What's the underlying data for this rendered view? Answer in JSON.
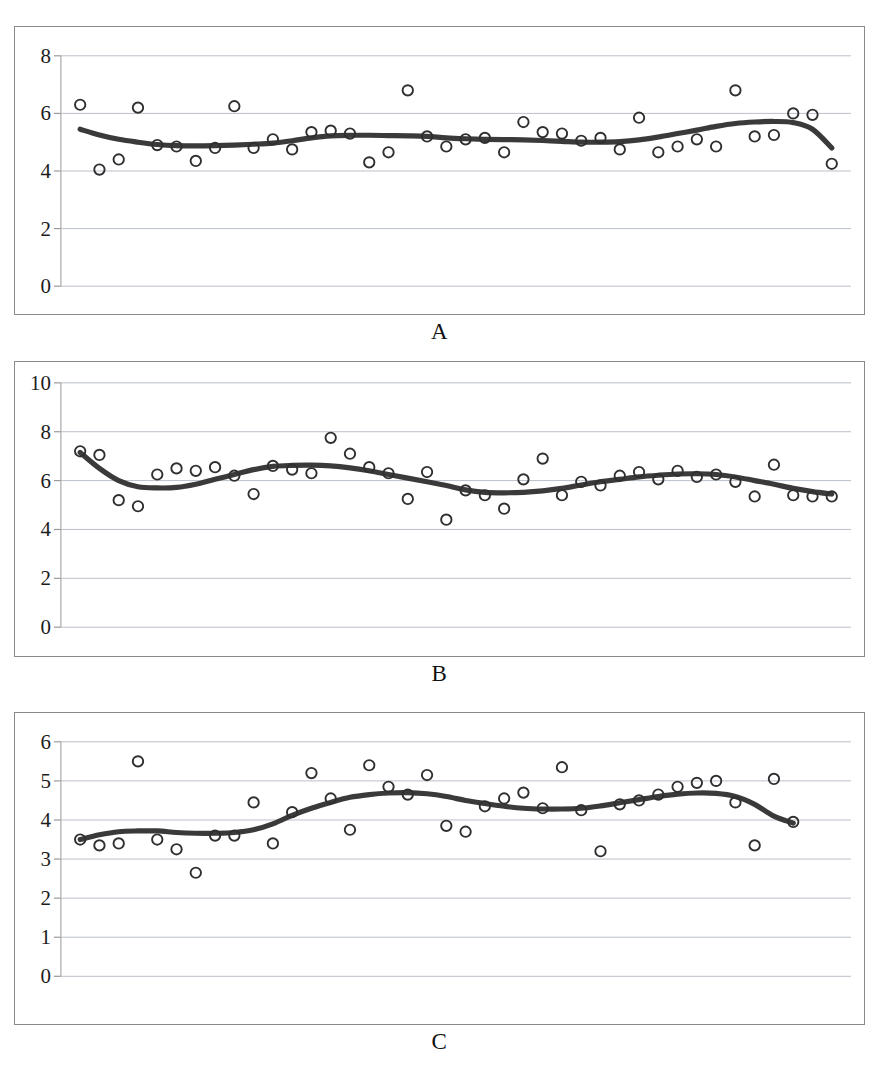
{
  "figure": {
    "background": "#ffffff",
    "marker_color": "#2f2f2f",
    "curve_color": "#3a3a3a",
    "grid_color": "#b9bfc9"
  },
  "panels": [
    {
      "id": "a",
      "caption": "A"
    },
    {
      "id": "b",
      "caption": "B"
    },
    {
      "id": "c",
      "caption": "C"
    }
  ],
  "chart_data": [
    {
      "type": "scatter",
      "title": "A",
      "xlabel": "",
      "ylabel": "",
      "grid": true,
      "legend": "none",
      "xlim": [
        0,
        41
      ],
      "ylim": [
        0,
        8
      ],
      "ytick_labels": [
        "0",
        "2",
        "4",
        "6",
        "8"
      ],
      "yticks": [
        0,
        2,
        4,
        6,
        8
      ],
      "xtick_labels": [],
      "x": [
        1,
        2,
        3,
        4,
        5,
        6,
        7,
        8,
        9,
        10,
        11,
        12,
        13,
        14,
        15,
        16,
        17,
        18,
        19,
        20,
        21,
        22,
        23,
        24,
        25,
        26,
        27,
        28,
        29,
        30,
        31,
        32,
        33,
        34,
        35,
        36,
        37,
        38,
        39,
        40
      ],
      "values": [
        6.3,
        4.05,
        4.4,
        6.2,
        4.9,
        4.85,
        4.35,
        4.8,
        6.25,
        4.8,
        5.1,
        4.75,
        5.35,
        5.4,
        5.3,
        4.3,
        4.65,
        6.8,
        5.2,
        4.85,
        5.1,
        5.15,
        4.65,
        5.7,
        5.35,
        5.3,
        5.05,
        5.15,
        4.75,
        5.85,
        4.65,
        4.85,
        5.1,
        4.85,
        6.8,
        5.2,
        5.25,
        6.0,
        5.95,
        4.25
      ],
      "series": [
        {
          "name": "observed",
          "marker": "open-circle",
          "values": [
            6.3,
            4.05,
            4.4,
            6.2,
            4.9,
            4.85,
            4.35,
            4.8,
            6.25,
            4.8,
            5.1,
            4.75,
            5.35,
            5.4,
            5.3,
            4.3,
            4.65,
            6.8,
            5.2,
            4.85,
            5.1,
            5.15,
            4.65,
            5.7,
            5.35,
            5.3,
            5.05,
            5.15,
            4.75,
            5.85,
            4.65,
            4.85,
            5.1,
            4.85,
            6.8,
            5.2,
            5.25,
            6.0,
            5.95,
            4.25
          ]
        },
        {
          "name": "smoothed-trend",
          "marker": "none",
          "values": [
            5.45,
            5.25,
            5.1,
            5.0,
            4.92,
            4.88,
            4.87,
            4.88,
            4.9,
            4.93,
            4.97,
            5.05,
            5.15,
            5.22,
            5.24,
            5.24,
            5.23,
            5.22,
            5.2,
            5.15,
            5.12,
            5.1,
            5.09,
            5.08,
            5.06,
            5.03,
            5.0,
            5.0,
            5.02,
            5.08,
            5.18,
            5.3,
            5.42,
            5.55,
            5.65,
            5.7,
            5.72,
            5.68,
            5.45,
            4.8
          ]
        }
      ]
    },
    {
      "type": "scatter",
      "title": "B",
      "xlabel": "",
      "ylabel": "",
      "grid": true,
      "legend": "none",
      "xlim": [
        0,
        41
      ],
      "ylim": [
        0,
        10
      ],
      "ytick_labels": [
        "0",
        "2",
        "4",
        "6",
        "8",
        "10"
      ],
      "yticks": [
        0,
        2,
        4,
        6,
        8,
        10
      ],
      "xtick_labels": [],
      "x": [
        1,
        2,
        3,
        4,
        5,
        6,
        7,
        8,
        9,
        10,
        11,
        12,
        13,
        14,
        15,
        16,
        17,
        18,
        19,
        20,
        21,
        22,
        23,
        24,
        25,
        26,
        27,
        28,
        29,
        30,
        31,
        32,
        33,
        34,
        35,
        36,
        37,
        38,
        39,
        40
      ],
      "values": [
        7.2,
        7.05,
        5.2,
        4.95,
        6.25,
        6.5,
        6.4,
        6.55,
        6.2,
        5.45,
        6.6,
        6.45,
        6.3,
        7.75,
        7.1,
        6.55,
        6.3,
        5.25,
        6.35,
        4.4,
        5.6,
        5.4,
        4.85,
        6.05,
        6.9,
        5.4,
        5.95,
        5.8,
        6.2,
        6.35,
        6.05,
        6.4,
        6.15,
        6.25,
        5.95,
        5.35,
        6.65,
        5.4,
        5.35,
        5.35
      ],
      "series": [
        {
          "name": "observed",
          "marker": "open-circle",
          "values": [
            7.2,
            7.05,
            5.2,
            4.95,
            6.25,
            6.5,
            6.4,
            6.55,
            6.2,
            5.45,
            6.6,
            6.45,
            6.3,
            7.75,
            7.1,
            6.55,
            6.3,
            5.25,
            6.35,
            4.4,
            5.6,
            5.4,
            4.85,
            6.05,
            6.9,
            5.4,
            5.95,
            5.8,
            6.2,
            6.35,
            6.05,
            6.4,
            6.15,
            6.25,
            5.95,
            5.35,
            6.65,
            5.4,
            5.35,
            5.35
          ]
        },
        {
          "name": "smoothed-trend",
          "marker": "none",
          "values": [
            7.15,
            6.5,
            6.0,
            5.75,
            5.7,
            5.72,
            5.85,
            6.05,
            6.25,
            6.45,
            6.58,
            6.62,
            6.63,
            6.6,
            6.52,
            6.4,
            6.25,
            6.1,
            5.95,
            5.8,
            5.62,
            5.52,
            5.5,
            5.52,
            5.58,
            5.68,
            5.82,
            5.95,
            6.05,
            6.15,
            6.22,
            6.27,
            6.28,
            6.25,
            6.15,
            6.0,
            5.85,
            5.68,
            5.55,
            5.45
          ]
        }
      ]
    },
    {
      "type": "scatter",
      "title": "C",
      "xlabel": "",
      "ylabel": "",
      "grid": true,
      "legend": "none",
      "xlim": [
        0,
        41
      ],
      "ylim": [
        0,
        6
      ],
      "ytick_labels": [
        "0",
        "1",
        "2",
        "3",
        "4",
        "5",
        "6"
      ],
      "yticks": [
        0,
        1,
        2,
        3,
        4,
        5,
        6
      ],
      "xtick_labels": [],
      "x": [
        1,
        2,
        3,
        4,
        5,
        6,
        7,
        8,
        9,
        10,
        11,
        12,
        13,
        14,
        15,
        16,
        17,
        18,
        19,
        20,
        21,
        22,
        23,
        24,
        25,
        26,
        27,
        28,
        29,
        30,
        31,
        32,
        33,
        34,
        35,
        36,
        37,
        38,
        39,
        40
      ],
      "values": [
        3.5,
        3.35,
        3.4,
        5.5,
        3.5,
        3.25,
        2.65,
        3.6,
        3.6,
        4.45,
        3.4,
        4.2,
        5.2,
        4.55,
        3.75,
        5.4,
        4.85,
        4.65,
        5.15,
        3.85,
        3.7,
        4.35,
        4.55,
        4.7,
        4.3,
        5.35,
        4.25,
        3.2,
        4.4,
        4.5,
        4.65,
        4.85,
        4.95,
        5.0,
        4.45,
        3.35,
        5.05,
        3.95
      ],
      "series": [
        {
          "name": "observed",
          "marker": "open-circle",
          "values": [
            3.5,
            3.35,
            3.4,
            5.5,
            3.5,
            3.25,
            2.65,
            3.6,
            3.6,
            4.45,
            3.4,
            4.2,
            5.2,
            4.55,
            3.75,
            5.4,
            4.85,
            4.65,
            5.15,
            3.85,
            3.7,
            4.35,
            4.55,
            4.7,
            4.3,
            5.35,
            4.25,
            3.2,
            4.4,
            4.5,
            4.65,
            4.85,
            4.95,
            5.0,
            4.45,
            3.35,
            5.05,
            3.95
          ]
        },
        {
          "name": "smoothed-trend",
          "marker": "none",
          "values": [
            3.5,
            3.62,
            3.7,
            3.72,
            3.72,
            3.68,
            3.66,
            3.66,
            3.68,
            3.75,
            3.9,
            4.12,
            4.3,
            4.45,
            4.58,
            4.65,
            4.69,
            4.7,
            4.67,
            4.6,
            4.5,
            4.42,
            4.35,
            4.3,
            4.28,
            4.28,
            4.3,
            4.36,
            4.44,
            4.52,
            4.6,
            4.66,
            4.69,
            4.68,
            4.6,
            4.4,
            4.1,
            3.92
          ]
        }
      ]
    }
  ]
}
